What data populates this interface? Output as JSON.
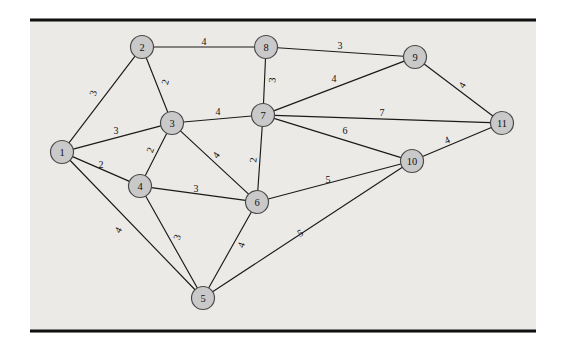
{
  "figure": {
    "background_color": "#eceae7",
    "page_color": "#ffffff",
    "node_fill": "#c9c9c9",
    "node_stroke": "#4a4a4a",
    "edge_color": "#1a1a1a",
    "rule_color": "#111111"
  },
  "plate": {
    "x": 30,
    "y": 20,
    "width": 506,
    "height": 313
  },
  "rules": [
    {
      "name": "top-rule",
      "x1": 30,
      "y1": 20,
      "x2": 536,
      "y2": 20
    },
    {
      "name": "bottom-rule",
      "x1": 30,
      "y1": 331,
      "x2": 536,
      "y2": 331
    }
  ],
  "chart_data": {
    "type": "diagram",
    "subtype": "weighted-undirected-graph",
    "title": "",
    "node_count": 11,
    "edge_count": 22,
    "node_radius": 11.5,
    "nodes": [
      {
        "id": "1",
        "label": "1",
        "x": 62,
        "y": 152
      },
      {
        "id": "2",
        "label": "2",
        "x": 142,
        "y": 47
      },
      {
        "id": "3",
        "label": "3",
        "x": 172,
        "y": 123
      },
      {
        "id": "4",
        "label": "4",
        "x": 140,
        "y": 186
      },
      {
        "id": "5",
        "label": "5",
        "x": 203,
        "y": 298
      },
      {
        "id": "6",
        "label": "6",
        "x": 257,
        "y": 202
      },
      {
        "id": "7",
        "label": "7",
        "x": 263,
        "y": 115
      },
      {
        "id": "8",
        "label": "8",
        "x": 266,
        "y": 47
      },
      {
        "id": "9",
        "label": "9",
        "x": 415,
        "y": 57
      },
      {
        "id": "10",
        "label": "10",
        "x": 412,
        "y": 161
      },
      {
        "id": "11",
        "label": "11",
        "x": 502,
        "y": 123
      }
    ],
    "edges": [
      {
        "source": "1",
        "target": "2",
        "weight": 3,
        "label": "3",
        "lx": 93,
        "ly": 93,
        "rotate": -75
      },
      {
        "source": "1",
        "target": "3",
        "weight": 3,
        "label": "3",
        "lx": 116,
        "ly": 130,
        "rotate": 0
      },
      {
        "source": "1",
        "target": "4",
        "weight": 2,
        "label": "2",
        "lx": 101,
        "ly": 164,
        "rotate": 0
      },
      {
        "source": "1",
        "target": "5",
        "weight": 4,
        "label": "4",
        "lx": 118,
        "ly": 230,
        "rotate": -62
      },
      {
        "source": "2",
        "target": "3",
        "weight": 2,
        "label": "2",
        "lx": 165,
        "ly": 82,
        "rotate": -75
      },
      {
        "source": "2",
        "target": "8",
        "weight": 4,
        "label": "4",
        "lx": 204,
        "ly": 41,
        "rotate": 0
      },
      {
        "source": "3",
        "target": "4",
        "weight": 2,
        "label": "2",
        "lx": 150,
        "ly": 150,
        "rotate": -70
      },
      {
        "source": "3",
        "target": "6",
        "weight": 4,
        "label": "4",
        "lx": 216,
        "ly": 155,
        "rotate": -55
      },
      {
        "source": "3",
        "target": "7",
        "weight": 4,
        "label": "4",
        "lx": 218,
        "ly": 111,
        "rotate": 0
      },
      {
        "source": "4",
        "target": "5",
        "weight": 3,
        "label": "3",
        "lx": 177,
        "ly": 237,
        "rotate": -72
      },
      {
        "source": "4",
        "target": "6",
        "weight": 3,
        "label": "3",
        "lx": 196,
        "ly": 188,
        "rotate": 0
      },
      {
        "source": "5",
        "target": "6",
        "weight": 4,
        "label": "4",
        "lx": 241,
        "ly": 245,
        "rotate": -70
      },
      {
        "source": "5",
        "target": "10",
        "weight": 5,
        "label": "5",
        "lx": 300,
        "ly": 233,
        "rotate": -28
      },
      {
        "source": "6",
        "target": "7",
        "weight": 2,
        "label": "2",
        "lx": 253,
        "ly": 160,
        "rotate": -85
      },
      {
        "source": "6",
        "target": "10",
        "weight": 5,
        "label": "5",
        "lx": 328,
        "ly": 179,
        "rotate": 0
      },
      {
        "source": "7",
        "target": "8",
        "weight": 3,
        "label": "3",
        "lx": 272,
        "ly": 80,
        "rotate": -85
      },
      {
        "source": "7",
        "target": "9",
        "weight": 4,
        "label": "4",
        "lx": 334,
        "ly": 78,
        "rotate": 0
      },
      {
        "source": "7",
        "target": "10",
        "weight": 6,
        "label": "6",
        "lx": 345,
        "ly": 130,
        "rotate": 0
      },
      {
        "source": "7",
        "target": "11",
        "weight": 7,
        "label": "7",
        "lx": 382,
        "ly": 112,
        "rotate": 0
      },
      {
        "source": "8",
        "target": "9",
        "weight": 3,
        "label": "3",
        "lx": 340,
        "ly": 45,
        "rotate": 0
      },
      {
        "source": "9",
        "target": "11",
        "weight": 4,
        "label": "4",
        "lx": 462,
        "ly": 85,
        "rotate": -58
      },
      {
        "source": "10",
        "target": "11",
        "weight": 4,
        "label": "4",
        "lx": 447,
        "ly": 140,
        "rotate": -25
      }
    ],
    "adjacency_note": "",
    "legend": [],
    "grid": false
  }
}
